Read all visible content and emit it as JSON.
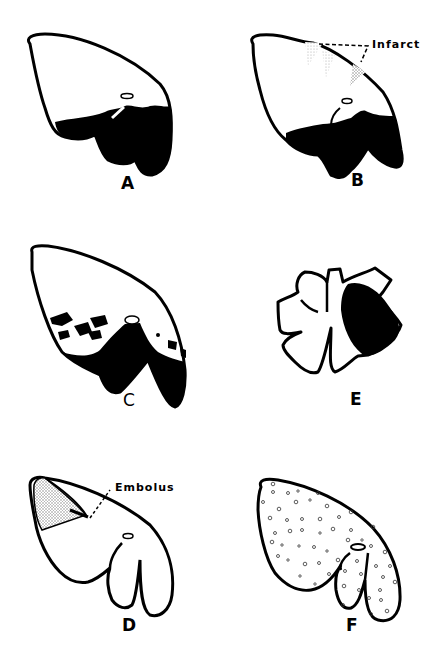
{
  "figure": {
    "panels": [
      {
        "id": "A",
        "label": "A",
        "description": "Lung with dependent dark consolidation in lower portion"
      },
      {
        "id": "B",
        "label": "B",
        "description": "Lung with dependent consolidation and peripheral infarcts",
        "callout": "Infarct"
      },
      {
        "id": "C",
        "label": "C",
        "description": "Lung with patchy dark areas and dependent consolidation"
      },
      {
        "id": "D",
        "label": "D",
        "description": "Lung with stippled wedge-shaped region distal to embolus",
        "callout": "Embolus"
      },
      {
        "id": "E",
        "label": "E",
        "description": "Lobulated lung with one lobe fully dark"
      },
      {
        "id": "F",
        "label": "F",
        "description": "Lung with diffuse small circular nodules"
      }
    ],
    "colors": {
      "ink": "#000000",
      "background": "#ffffff",
      "stipple": "#9a9a9a"
    }
  }
}
